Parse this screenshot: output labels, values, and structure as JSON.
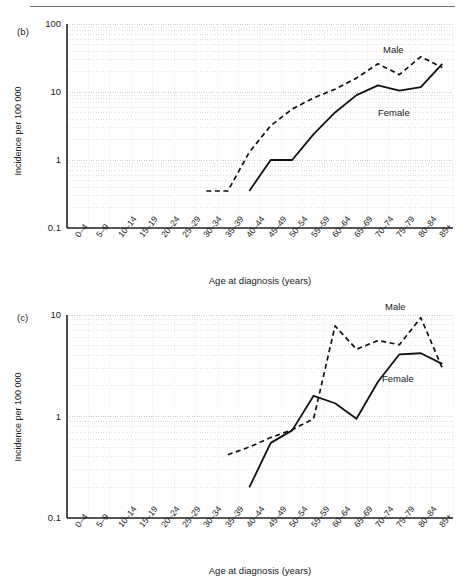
{
  "figure": {
    "panels": [
      {
        "id": "b",
        "panel_label": "(b)",
        "series_labels": {
          "male": "Male",
          "female": "Female"
        }
      },
      {
        "id": "c",
        "panel_label": "(c)",
        "series_labels": {
          "male": "Male",
          "female": "Female"
        }
      }
    ]
  },
  "chart_data": [
    {
      "type": "line",
      "panel": "(b)",
      "title": "",
      "xlabel": "Age at diagnosis (years)",
      "ylabel": "Incidence per 100 000",
      "yscale": "log",
      "ylim": [
        0.1,
        100
      ],
      "ytick_labels": [
        "100",
        "10",
        "1",
        "0.1"
      ],
      "ytick_values": [
        100,
        10,
        1,
        0.1
      ],
      "grid": true,
      "legend": "inline-annotation",
      "categories": [
        "0–4",
        "5–9",
        "10–14",
        "15–19",
        "20–24",
        "25–29",
        "30–34",
        "35–39",
        "40–44",
        "45–49",
        "50–54",
        "55–59",
        "60–64",
        "65–69",
        "70–74",
        "75–79",
        "80–84",
        "85+"
      ],
      "series": [
        {
          "name": "Male",
          "style": "dashed",
          "values": [
            null,
            null,
            null,
            null,
            null,
            null,
            0.35,
            0.35,
            1.3,
            3.2,
            5.6,
            8.2,
            11.0,
            16.0,
            26.0,
            18.0,
            33.0,
            23.0
          ]
        },
        {
          "name": "Female",
          "style": "solid",
          "values": [
            null,
            null,
            null,
            null,
            null,
            null,
            null,
            null,
            0.35,
            1.0,
            1.0,
            2.4,
            5.0,
            9.0,
            12.5,
            10.5,
            11.8,
            26.0
          ]
        }
      ]
    },
    {
      "type": "line",
      "panel": "(c)",
      "title": "",
      "xlabel": "Age at diagnosis (years)",
      "ylabel": "Incidence per 100 000",
      "yscale": "log",
      "ylim": [
        0.1,
        10
      ],
      "ytick_labels": [
        "10",
        "1",
        "0.1"
      ],
      "ytick_values": [
        10,
        1,
        0.1
      ],
      "grid": true,
      "legend": "inline-annotation",
      "categories": [
        "0–4",
        "5–9",
        "10–14",
        "15–19",
        "20–24",
        "25–29",
        "30–34",
        "35–39",
        "40–44",
        "45–49",
        "50–54",
        "55–59",
        "60–64",
        "65–69",
        "70–74",
        "75–79",
        "80–84",
        "85+"
      ],
      "series": [
        {
          "name": "Male",
          "style": "dashed",
          "values": [
            null,
            null,
            null,
            null,
            null,
            null,
            null,
            0.42,
            0.5,
            0.62,
            0.74,
            0.95,
            7.8,
            4.6,
            5.6,
            5.1,
            9.4,
            3.0
          ]
        },
        {
          "name": "Female",
          "style": "solid",
          "values": [
            null,
            null,
            null,
            null,
            null,
            null,
            null,
            null,
            0.2,
            0.55,
            0.73,
            1.6,
            1.35,
            0.95,
            2.2,
            4.1,
            4.2,
            3.3
          ]
        }
      ]
    }
  ]
}
